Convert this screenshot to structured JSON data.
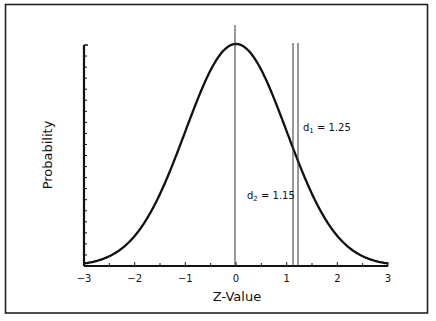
{
  "chart_data": {
    "type": "line",
    "title": "",
    "xlabel": "Z-Value",
    "ylabel": "Probability",
    "xlim": [
      -3,
      3
    ],
    "ylim": [
      0,
      0.4
    ],
    "x_ticks": [
      "-3",
      "-2",
      "-1",
      "0",
      "1",
      "2",
      "3"
    ],
    "y_ticks_labeled": false,
    "grid": false,
    "legend": null,
    "series": [
      {
        "name": "Standard normal density",
        "x": [
          -3,
          -2.5,
          -2,
          -1.5,
          -1,
          -0.5,
          0,
          0.5,
          1,
          1.15,
          1.25,
          1.5,
          2,
          2.5,
          3
        ],
        "values": [
          0.0044,
          0.0175,
          0.054,
          0.1295,
          0.242,
          0.352,
          0.399,
          0.352,
          0.242,
          0.2059,
          0.1826,
          0.1295,
          0.054,
          0.0175,
          0.0044
        ]
      }
    ],
    "reference_lines": [
      {
        "x": 0,
        "label": ""
      },
      {
        "x": 1.15,
        "label": "d2 = 1.15"
      },
      {
        "x": 1.25,
        "label": "d1 = 1.25"
      }
    ],
    "annotations": [
      {
        "text": "d1 = 1.25",
        "sub": "1",
        "prefix": "d",
        "value": "= 1.25"
      },
      {
        "text": "d2 = 1.15",
        "sub": "2",
        "prefix": "d",
        "value": "= 1.15"
      }
    ]
  },
  "labels": {
    "xlabel": "Z-Value",
    "ylabel": "Probability",
    "x_ticks": [
      "−3",
      "−2",
      "−1",
      "0",
      "1",
      "2",
      "3"
    ],
    "d1": {
      "prefix": "d",
      "sub": "1",
      "value": " = 1.25"
    },
    "d2": {
      "prefix": "d",
      "sub": "2",
      "value": " = 1.15"
    }
  }
}
